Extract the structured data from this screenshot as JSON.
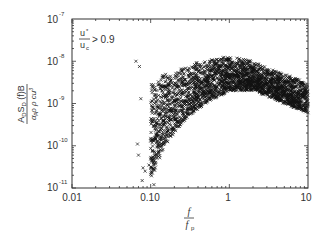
{
  "chart_data": {
    "type": "scatter",
    "title": "",
    "xlabel": "f / f_p",
    "ylabel": "A_D S_D(f) B / (α_p ρ_a ρ_w c u_*^3)",
    "xscale": "log",
    "yscale": "log",
    "xlim": [
      0.01,
      10
    ],
    "ylim": [
      1e-11,
      1e-07
    ],
    "x_ticks": [
      "0.01",
      "0.10",
      "1",
      "10"
    ],
    "y_ticks": [
      "10^-11",
      "10^-10",
      "10^-9",
      "10^-8",
      "10^-7"
    ],
    "grid": false,
    "legend": null,
    "marker": "x",
    "annotation": "u*/u_c > 0.9",
    "series": [
      {
        "name": "u*/u_c > 0.9",
        "envelope": {
          "x": [
            0.1,
            0.15,
            0.2,
            0.3,
            0.5,
            1.0,
            2.0,
            3.0,
            5.0,
            10.0
          ],
          "upper": [
            3e-09,
            5e-09,
            6e-09,
            8e-09,
            1.1e-08,
            1.3e-08,
            1e-08,
            7e-09,
            5e-09,
            3e-09
          ],
          "lower": [
            1.5e-11,
            1e-10,
            2e-10,
            5e-10,
            1e-09,
            2e-09,
            2e-09,
            1.5e-09,
            1e-09,
            6e-10
          ]
        },
        "outliers": [
          {
            "x": 0.065,
            "y": 1e-08
          },
          {
            "x": 0.072,
            "y": 7.5e-09
          },
          {
            "x": 0.075,
            "y": 1.3e-09
          },
          {
            "x": 0.068,
            "y": 1.1e-10
          },
          {
            "x": 0.07,
            "y": 6e-11
          },
          {
            "x": 0.08,
            "y": 3e-11
          },
          {
            "x": 0.085,
            "y": 2.5e-11
          },
          {
            "x": 0.095,
            "y": 3.5e-11
          },
          {
            "x": 0.078,
            "y": 1.5e-11
          },
          {
            "x": 0.11,
            "y": 1.2e-11
          }
        ]
      }
    ]
  },
  "axes": {
    "x_tick_labels": [
      "0.01",
      "0.10",
      "1",
      "10"
    ],
    "y_tick_bases": [
      "10",
      "10",
      "10",
      "10",
      "10"
    ],
    "y_tick_exps": [
      "-11",
      "-10",
      "-9",
      "-8",
      "-7"
    ],
    "xlabel_num": "f",
    "xlabel_den": "f",
    "xlabel_den_sub": "p"
  },
  "annotation": {
    "num": "u",
    "num_sub": "*",
    "den": "u",
    "den_sub": "c",
    "text": "> 0.9"
  },
  "ylabel": {
    "num": "A",
    "num_sub1": "D",
    "num_mid": "S",
    "num_sub2": "D",
    "num_tail": " (f)B",
    "den": "α",
    "den_rest": "ρ ρ cu",
    "den_exp": "3"
  }
}
